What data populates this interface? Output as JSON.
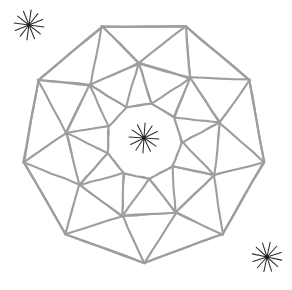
{
  "figure": {
    "kind": "geometric-line-drawing",
    "background_color": "#ffffff",
    "line_color": "#9e9e9e",
    "line_width": 2.1,
    "mark_color": "#2b2b2b",
    "canvas": {
      "width": 292,
      "height": 290
    },
    "symmetry_order": 9,
    "center": {
      "x": 144,
      "y": 141
    },
    "outer_radius": 122,
    "mid_radius": 78,
    "inner_radius": 38,
    "ring_twist_degrees": 16,
    "rings": [
      {
        "name": "outer-ring",
        "tiles": 9,
        "radius_outer": 122,
        "radius_inner": 78
      },
      {
        "name": "middle-ring",
        "tiles": 9,
        "radius_outer": 78,
        "radius_inner": 38
      }
    ],
    "starbursts": [
      {
        "name": "starburst-top-left",
        "x": 29,
        "y": 25,
        "radius": 15,
        "rays": 12,
        "rotation": 8
      },
      {
        "name": "starburst-center",
        "x": 144,
        "y": 138,
        "radius": 15,
        "rays": 12,
        "rotation": 4
      },
      {
        "name": "starburst-bottom-right",
        "x": 267,
        "y": 257,
        "radius": 15,
        "rays": 12,
        "rotation": 12
      }
    ]
  }
}
